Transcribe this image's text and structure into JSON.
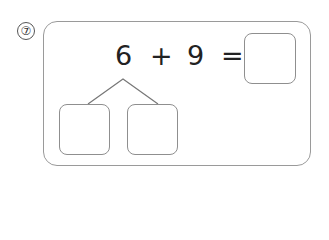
{
  "problem": {
    "number_label": "⑦",
    "number": 7,
    "equation": {
      "operand1": "6",
      "operator": "+",
      "operand2": "9",
      "equals": "=",
      "answer": ""
    },
    "decomposition": {
      "splits_operand": "6",
      "left_box": "",
      "right_box": ""
    }
  }
}
